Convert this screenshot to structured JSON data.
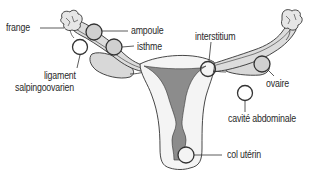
{
  "diagram": {
    "labels": {
      "frange": "frange",
      "ampoule": "ampoule",
      "isthme": "isthme",
      "ligament_line1": "ligament",
      "ligament_line2": "salpingoovarien",
      "interstitium": "interstitium",
      "ovaire": "ovaire",
      "cavite_abdominale": "cavité abdominale",
      "col_uterin": "col utérin"
    },
    "colors": {
      "outline": "#333333",
      "tube_fill": "#dcdcdc",
      "ovary_fill": "#d8d8d8",
      "cavity_fill": "#8c8c8c",
      "uterus_fill": "#f4f4f4",
      "text": "#2a2a2a"
    }
  }
}
